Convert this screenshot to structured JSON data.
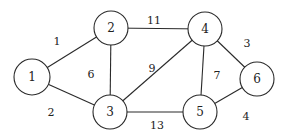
{
  "graph": {
    "type": "undirected-weighted",
    "nodes": [
      {
        "id": "1",
        "label": "1",
        "x": 32,
        "y": 77,
        "r": 18
      },
      {
        "id": "2",
        "label": "2",
        "x": 111,
        "y": 28,
        "r": 17
      },
      {
        "id": "3",
        "label": "3",
        "x": 110,
        "y": 112,
        "r": 17
      },
      {
        "id": "4",
        "label": "4",
        "x": 205,
        "y": 29,
        "r": 17
      },
      {
        "id": "5",
        "label": "5",
        "x": 200,
        "y": 112,
        "r": 17
      },
      {
        "id": "6",
        "label": "6",
        "x": 257,
        "y": 79,
        "r": 17
      }
    ],
    "edges": [
      {
        "from": "1",
        "to": "2",
        "weight": "1",
        "lx": 57,
        "ly": 41
      },
      {
        "from": "1",
        "to": "3",
        "weight": "2",
        "lx": 51,
        "ly": 112
      },
      {
        "from": "2",
        "to": "3",
        "weight": "6",
        "lx": 91,
        "ly": 74
      },
      {
        "from": "2",
        "to": "4",
        "weight": "11",
        "lx": 154,
        "ly": 20
      },
      {
        "from": "3",
        "to": "4",
        "weight": "9",
        "lx": 152,
        "ly": 68
      },
      {
        "from": "3",
        "to": "5",
        "weight": "13",
        "lx": 157,
        "ly": 125
      },
      {
        "from": "4",
        "to": "5",
        "weight": "7",
        "lx": 217,
        "ly": 75
      },
      {
        "from": "4",
        "to": "6",
        "weight": "3",
        "lx": 247,
        "ly": 43
      },
      {
        "from": "5",
        "to": "6",
        "weight": "4",
        "lx": 246,
        "ly": 116
      }
    ]
  }
}
